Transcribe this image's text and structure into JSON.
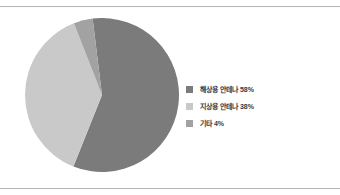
{
  "chart_data": {
    "type": "pie",
    "title": "",
    "subtitle": "",
    "xlabel": "",
    "ylabel": "",
    "grid": false,
    "legend_position": "right",
    "start_angle_deg": -7,
    "direction": "clockwise",
    "categories": [
      "해상용 안테나",
      "지상용 안테나",
      "기타"
    ],
    "values": [
      58,
      38,
      4
    ],
    "value_unit": "%",
    "labels": [
      "해상용 안테나 58%",
      "지상용 안테나 38%",
      "기타 4%"
    ],
    "colors": [
      "#7b7b7b",
      "#c9c9c9",
      "#a2a2a2"
    ],
    "slices": [
      {
        "label": "해상용 안테나",
        "value": 58,
        "display": "해상용 안테나 58%",
        "color": "#7b7b7b"
      },
      {
        "label": "지상용 안테나",
        "value": 38,
        "display": "지상용 안테나 38%",
        "color": "#c9c9c9"
      },
      {
        "label": "기타",
        "value": 4,
        "display": "기타 4%",
        "color": "#a2a2a2"
      }
    ]
  },
  "legend": {
    "items": [
      {
        "label": "해상용 안테나 58%",
        "color": "#7b7b7b"
      },
      {
        "label": "지상용 안테나 38%",
        "color": "#c9c9c9"
      },
      {
        "label": "기타 4%",
        "color": "#a2a2a2"
      }
    ]
  },
  "rules": {
    "color": "#b4b4b4"
  }
}
